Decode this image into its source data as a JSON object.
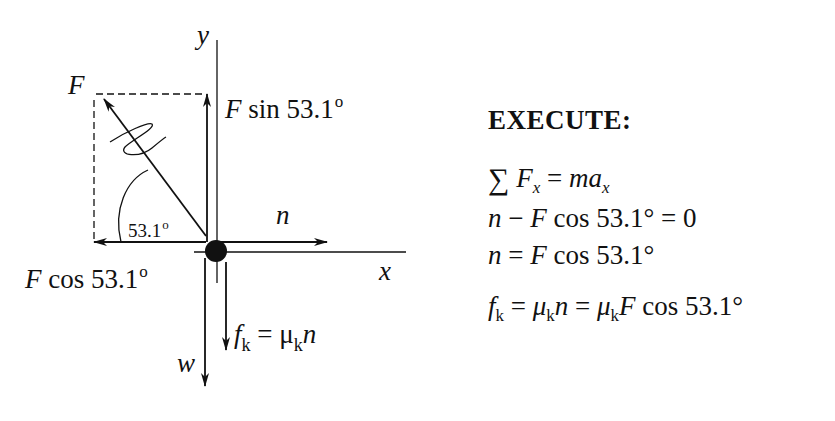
{
  "diagram": {
    "axis_labels": {
      "x": "x",
      "y": "y"
    },
    "forces": {
      "F": {
        "label": "F"
      },
      "F_sin": {
        "prefix": "F",
        "func": " sin ",
        "value": "53.1",
        "degree": "o"
      },
      "F_cos": {
        "prefix": "F",
        "func": " cos ",
        "value": "53.1",
        "degree": "o"
      },
      "n": {
        "label": "n"
      },
      "w": {
        "label": "w"
      },
      "fk": {
        "f": "f",
        "f_sub": "k",
        "eq": " = ",
        "mu": "μ",
        "mu_sub": "k",
        "n": "n"
      }
    },
    "angle": {
      "value": "53.1",
      "degree": "o"
    },
    "colors": {
      "ink": "#111111",
      "background": "#ffffff"
    }
  },
  "execute": {
    "title": "EXECUTE:",
    "equations": [
      {
        "parts": {
          "sigma": "∑",
          "F": " F",
          "sub": "x",
          "rest": " = ",
          "m": "ma",
          "sub2": "x"
        }
      },
      {
        "parts": {
          "n": "n",
          "rest": " − ",
          "F": "F",
          "func": " cos 53.1° = 0"
        }
      },
      {
        "parts": {
          "n": "n",
          "rest": " = ",
          "F": "F",
          "func": " cos 53.1°"
        }
      },
      {
        "parts": {
          "f": "f",
          "sub": "k",
          "eq1": " = ",
          "mu": "μ",
          "sub2": "k",
          "n": "n",
          "eq2": " = ",
          "mu2": "μ",
          "sub3": "k",
          "F": "F",
          "func": " cos 53.1°"
        }
      }
    ]
  }
}
